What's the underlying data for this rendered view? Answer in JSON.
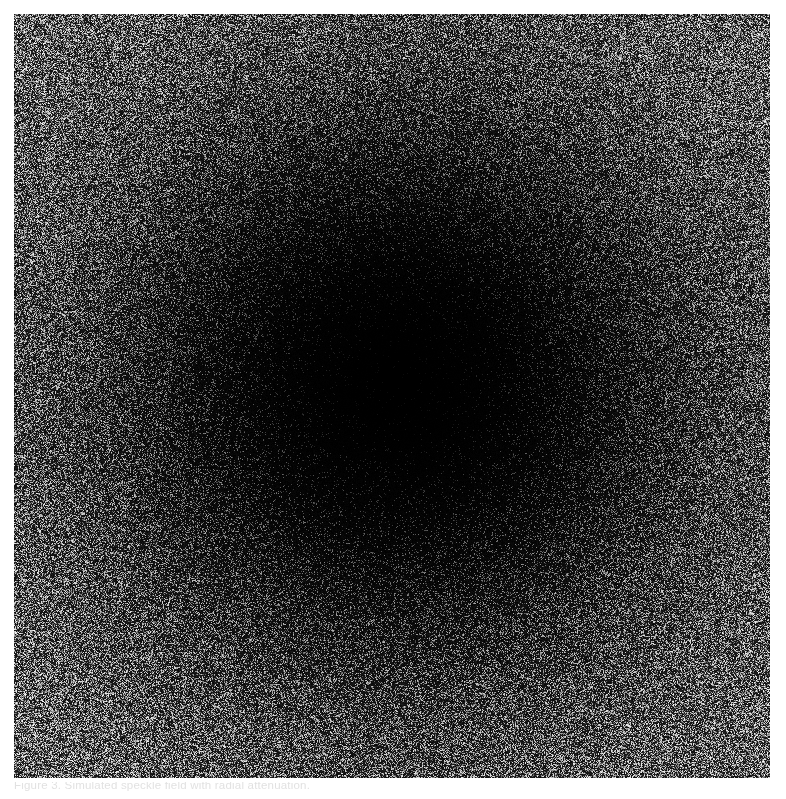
{
  "figure": {
    "kind": "noise-field-image",
    "plate": {
      "x": 14,
      "y": 14,
      "width": 756,
      "height": 764
    },
    "caption": {
      "text": "Figure 3. Simulated speckle field with radial attenuation.",
      "visible": "cropped",
      "color": "#c9c9c9"
    },
    "colors": {
      "page_background": "#ffffff",
      "plate_background": "#000000",
      "speckle_bright": "#f2f2f2",
      "speckle_mid": "#8c8c8c",
      "speckle_dark": "#1a1a1a",
      "center_core": "#050505"
    }
  },
  "chart_data": {
    "type": "heatmap",
    "title": "",
    "subtitle": "",
    "xlabel": "",
    "ylabel": "",
    "grid": false,
    "legend": "none",
    "colormap": "gray",
    "units": "normalised intensity",
    "xlim": [
      0,
      756
    ],
    "ylim": [
      0,
      764
    ],
    "zlim": [
      0,
      1
    ],
    "center": [
      386,
      374
    ],
    "x": [
      0,
      40,
      80,
      120,
      160,
      200,
      240,
      280,
      320,
      360,
      400,
      440,
      480,
      520
    ],
    "radial_profile": {
      "name": "mean intensity vs radius (px)",
      "radius_px": [
        0,
        40,
        80,
        120,
        160,
        200,
        240,
        280,
        320,
        360,
        400,
        440,
        480,
        520
      ],
      "values": [
        0.02,
        0.03,
        0.05,
        0.09,
        0.16,
        0.26,
        0.37,
        0.48,
        0.58,
        0.67,
        0.74,
        0.79,
        0.83,
        0.86
      ]
    },
    "series": [
      {
        "name": "mean intensity vs radius",
        "values": [
          0.02,
          0.03,
          0.05,
          0.09,
          0.16,
          0.26,
          0.37,
          0.48,
          0.58,
          0.67,
          0.74,
          0.79,
          0.83,
          0.86
        ]
      }
    ],
    "categories": [
      "0",
      "40",
      "80",
      "120",
      "160",
      "200",
      "240",
      "280",
      "320",
      "360",
      "400",
      "440",
      "480",
      "520"
    ],
    "sample_points": [
      {
        "label": "centre",
        "x": 386,
        "y": 374,
        "value": 0.02
      },
      {
        "label": "mid-left",
        "x": 60,
        "y": 374,
        "value": 0.82
      },
      {
        "label": "mid-right",
        "x": 730,
        "y": 374,
        "value": 0.82
      },
      {
        "label": "mid-top",
        "x": 386,
        "y": 40,
        "value": 0.8
      },
      {
        "label": "mid-bottom",
        "x": 386,
        "y": 740,
        "value": 0.8
      },
      {
        "label": "top-left-corner",
        "x": 40,
        "y": 40,
        "value": 0.88
      },
      {
        "label": "top-right-corner",
        "x": 730,
        "y": 40,
        "value": 0.88
      },
      {
        "label": "bottom-left-corner",
        "x": 40,
        "y": 740,
        "value": 0.88
      },
      {
        "label": "bottom-right-corner",
        "x": 730,
        "y": 740,
        "value": 0.88
      }
    ]
  }
}
